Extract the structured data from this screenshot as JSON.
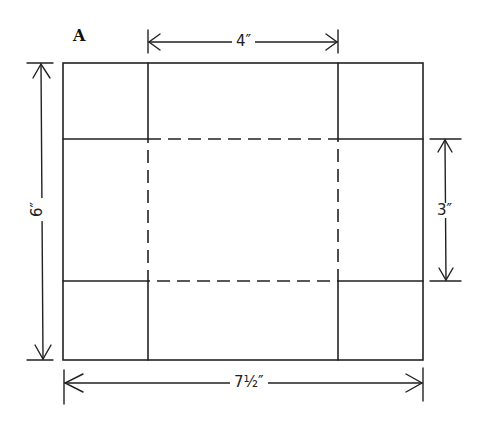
{
  "figure": {
    "label": "A",
    "stroke_color": "#222222",
    "dimensions": {
      "top": "4″",
      "left": "6″",
      "right": "3″",
      "bottom": "7½″"
    }
  }
}
